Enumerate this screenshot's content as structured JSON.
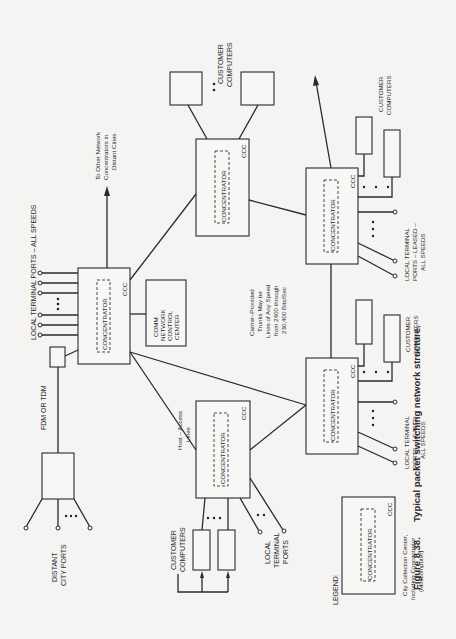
{
  "figure": {
    "number_label": "Figure 8.38.",
    "caption": "Typical packet switching network structure.",
    "orientation": "rotated 90deg counter-clockwise"
  },
  "labels": {
    "concentrator": "CONCENTRATOR",
    "ccc": "CCC",
    "ellipsis": "• • •",
    "local_terminal_ports_all_speeds": "LOCAL TERMINAL PORTS – ALL SPEEDS",
    "to_other_network": [
      "To Other Network",
      "Concentrators in",
      "Distant Cities"
    ],
    "customer_computers_top": [
      "CUSTOMER",
      "COMPUTERS"
    ],
    "customer_computers_right": [
      "CUSTOMER",
      "COMPUTERS"
    ],
    "customer_computers_mid": [
      "CUSTOMER",
      "COMPUTERS"
    ],
    "customer_computers_bottom": [
      "CUSTOMER",
      "COMPUTERS"
    ],
    "comm_network_control_center": [
      "COMM",
      "NETWORK",
      "CONTROL",
      "CENTER"
    ],
    "fdm_or_tdm": "FDM OR TDM",
    "distant_city_ports": [
      "DISTANT",
      "CITY PORTS"
    ],
    "host_access_lines": [
      "Host – Access",
      "Lines"
    ],
    "local_terminal_ports": [
      "LOCAL",
      "TERMINAL",
      "PORTS"
    ],
    "carrier_note": [
      "Carrier–Provided",
      "Trunks May be",
      "Lines of Any Speed",
      "from 2400 through",
      "230,400 Bits/Sec"
    ],
    "leased_ports_right": [
      "LOCAL  TERMINAL",
      "PORTS – LEASED –",
      "ALL  SPEEDS"
    ],
    "leased_ports_mid": [
      "LOCAL  TERMINAL",
      "PORTS – LEASED –",
      "ALL  SPEEDS"
    ]
  },
  "legend": {
    "title": "LEGEND:",
    "box_inner": "CONCENTRATOR",
    "box_tag": "CCC",
    "description": [
      "City Collection Center,",
      "Including Concentrator",
      "(Minicomputer)"
    ]
  },
  "nodes": [
    {
      "id": "ccc-main",
      "type": "concentrator"
    },
    {
      "id": "ccc-top",
      "type": "concentrator"
    },
    {
      "id": "ccc-right",
      "type": "concentrator"
    },
    {
      "id": "ccc-mid",
      "type": "concentrator"
    },
    {
      "id": "ccc-host",
      "type": "concentrator"
    },
    {
      "id": "comm-ncc",
      "type": "control-center"
    },
    {
      "id": "fdm-mux",
      "type": "multiplexer"
    },
    {
      "id": "distant-box",
      "type": "remote-mux"
    }
  ]
}
